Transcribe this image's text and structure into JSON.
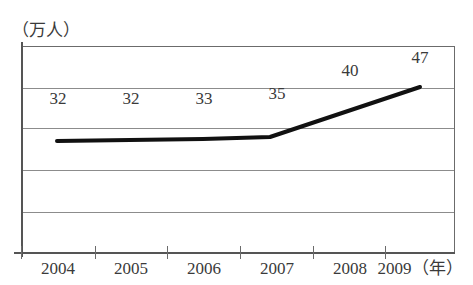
{
  "chart_data": {
    "type": "line",
    "title": "",
    "subtitle": "",
    "xlabel": "年",
    "ylabel": "万人",
    "y_unit_caption": "（万人）",
    "x_unit_caption": "（年）",
    "categories": [
      "2004",
      "2005",
      "2006",
      "2007",
      "2008",
      "2009"
    ],
    "values": [
      32,
      32,
      33,
      35,
      40,
      47
    ],
    "point_labels": [
      "32",
      "32",
      "33",
      "35",
      "40",
      "47"
    ],
    "series": [
      {
        "name": "人数",
        "values": [
          32,
          32,
          33,
          35,
          40,
          47
        ]
      }
    ],
    "ylim": [
      0,
      50
    ],
    "xlim": [
      "2004",
      "2009"
    ],
    "grid": true,
    "gridlines_count": 5,
    "legend": "none",
    "legend_position": "none",
    "line_color": "#111111",
    "grid_color": "#8c8c8c",
    "axis_color": "#555555",
    "background_color": "#ffffff",
    "markers": false,
    "y_tick_labels": [],
    "annotations": []
  },
  "plot": {
    "gridlines": [
      {
        "y": 42
      },
      {
        "y": 82
      },
      {
        "y": 124
      },
      {
        "y": 166
      },
      {
        "y": 205
      }
    ],
    "x_ticks": [
      21,
      95,
      167,
      240,
      313,
      385
    ],
    "points": [
      {
        "x": 57,
        "y": 141,
        "label": "32",
        "label_x": 58,
        "label_y": 98
      },
      {
        "x": 130,
        "y": 140,
        "label": "32",
        "label_y": 98,
        "label_x": 131
      },
      {
        "x": 203,
        "y": 139,
        "label": "33",
        "label_x": 204,
        "label_y": 98
      },
      {
        "x": 270,
        "y": 137,
        "label": "35",
        "label_x": 277,
        "label_y": 93
      },
      {
        "x": 345,
        "y": 112,
        "label": "40",
        "label_x": 350,
        "label_y": 70
      },
      {
        "x": 420,
        "y": 87,
        "label": "47",
        "label_x": 420,
        "label_y": 57
      }
    ],
    "category_label_positions": [
      58,
      131,
      204,
      277,
      350,
      428
    ]
  }
}
